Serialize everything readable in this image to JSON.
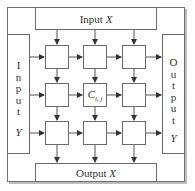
{
  "diagram": {
    "input_x": {
      "label": "Input",
      "var": "X"
    },
    "output_x": {
      "label": "Output",
      "var": "X"
    },
    "input_y": {
      "letters": [
        "I",
        "n",
        "p",
        "u",
        "t"
      ],
      "var": "Y"
    },
    "output_y": {
      "letters": [
        "O",
        "u",
        "t",
        "p",
        "u",
        "t"
      ],
      "var": "Y"
    },
    "grid": {
      "rows": 3,
      "cols": 3,
      "center_cell": {
        "base": "C",
        "subscript": "i, j"
      }
    },
    "colors": {
      "stroke": "#6a6a6a",
      "arrow": "#333333",
      "background": "#ffffff"
    }
  }
}
